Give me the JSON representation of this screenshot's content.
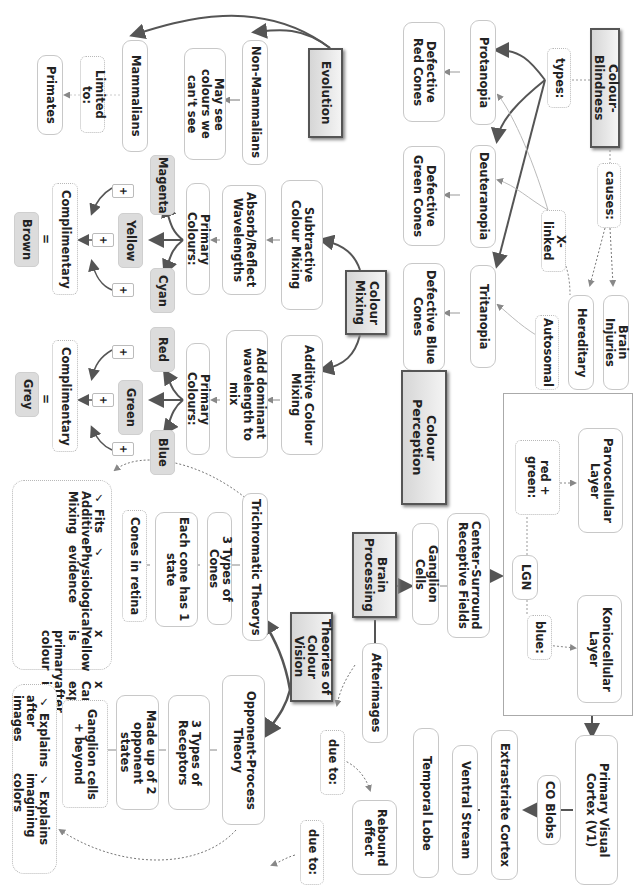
{
  "diagram": {
    "orientation": "rotated-90-clockwise",
    "colour_blindness": {
      "root": "Colour-Blindness",
      "types_label": "types:",
      "causes_label": "causes:",
      "types": [
        "Protanopia",
        "Deuteranopia",
        "Tritanopia"
      ],
      "defects": [
        "Defective Red Cones",
        "Defective Green Cones",
        "Defective Blue Cones"
      ],
      "causes": [
        "Brain Injuries",
        "Hereditary"
      ],
      "x_linked": "X-linked",
      "autosomal": "Autosomal"
    },
    "evolution": {
      "root": "Evolution",
      "non_mammalians": "Non-Mammalians",
      "non_mammalians_note": "May see colours we can't see",
      "mammalians": "Mammalians",
      "limited_to": "Limited to:",
      "primates": "Primates"
    },
    "colour_mixing": {
      "root": "Colour Mixing",
      "subtractive": {
        "title": "Subtractive Colour Mixing",
        "desc": "Absorb/Reflect Wavelengths",
        "primary_label": "Primary Colours:",
        "colours": [
          "Magenta",
          "Yellow",
          "Cyan"
        ],
        "plus": "+",
        "complimentary": "Complimentary",
        "equals": "=",
        "result": "Brown"
      },
      "additive": {
        "title": "Additive Colour Mixing",
        "desc": "Add dominant wavelength to mix",
        "primary_label": "Primary Colours:",
        "colours": [
          "Red",
          "Green",
          "Blue"
        ],
        "plus": "+",
        "complimentary": "Complimentary",
        "equals": "=",
        "result": "Grey"
      }
    },
    "colour_perception": {
      "title": "Colour Perception"
    },
    "brain_processing": {
      "root": "Brain Processing",
      "ganglion": "Ganglion Cells",
      "center_surround": "Center-Surround Receptive Fields",
      "lgn": "LGN",
      "red_green_label": "red + green:",
      "blue_label": "blue:",
      "parvocellular": "Parvocellular Layer",
      "koniocellular": "Koniocellular Layer",
      "v1": "Primary Visual Cortex (V1)",
      "co_blobs": "CO Blobs",
      "extrastriate": "Extrastriate Cortex",
      "ventral": "Ventral Stream",
      "temporal": "Temporal Lobe"
    },
    "afterimages": {
      "root": "Afterimages",
      "due_to_1": "due to:",
      "rebound": "Rebound effect",
      "due_to_2": "due to:"
    },
    "theories": {
      "root": "Theories of Colour Vision",
      "trichromatic": {
        "title": "Trichromatic Theorys",
        "types": "3 Types of Cones",
        "each": "Each cone has 1 state",
        "retina": "Cones in retina",
        "evaluation": [
          "✓ Fits Additive Mixing",
          "✓ Physiological evidence",
          "x Yellow is primary colour",
          "x Cannot explain after images"
        ]
      },
      "opponent": {
        "title": "Opponent-Process Theory",
        "types": "3 Types of Receptors",
        "made_up": "Made up of 2 opponent states",
        "ganglion": "Ganglion cells + beyond",
        "evaluation": [
          "✓ Explains after images",
          "✓ Explains imagining colors"
        ]
      }
    },
    "colors": {
      "line": "#555555",
      "light_line": "#aaaaaa",
      "box_border": "#c8c8c8",
      "fill": "#dcdcdc"
    }
  }
}
